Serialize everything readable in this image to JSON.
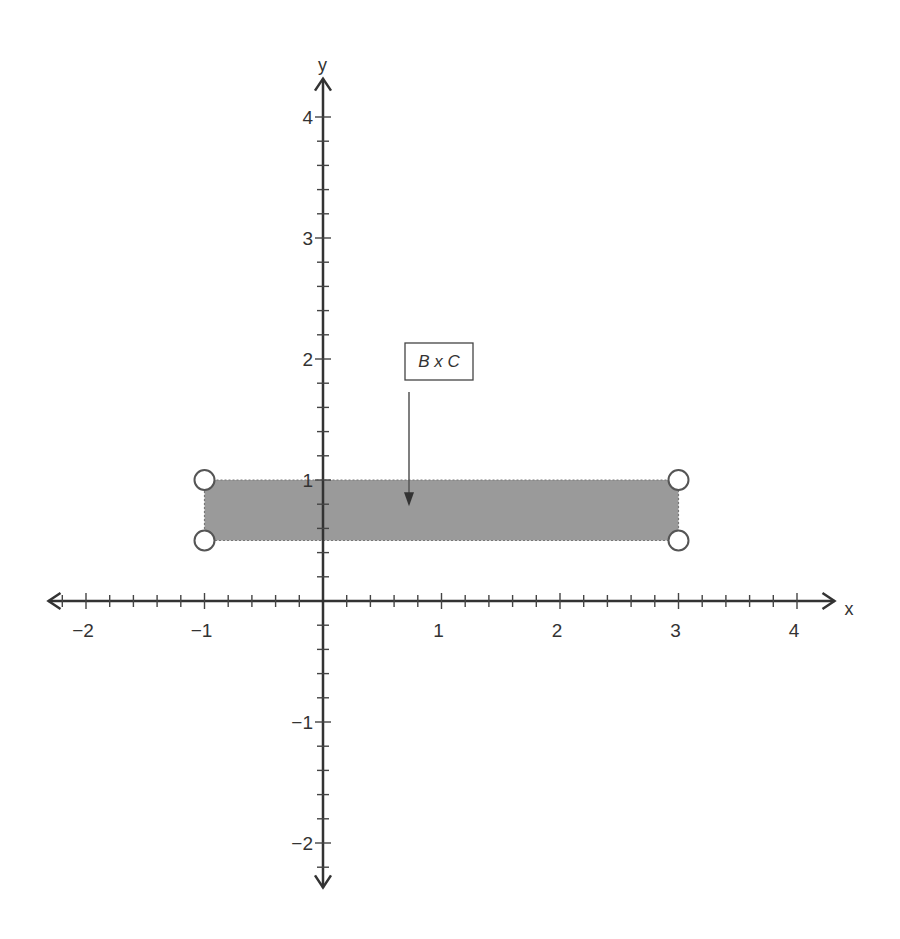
{
  "chart_data": {
    "type": "coordinate-plane",
    "title": "",
    "xlabel": "x",
    "ylabel": "y",
    "xlim": [
      -2.35,
      4.35
    ],
    "ylim": [
      -2.4,
      4.35
    ],
    "x_major_ticks": [
      -2,
      -1,
      1,
      2,
      3,
      4
    ],
    "y_major_ticks": [
      -2,
      -1,
      1,
      2,
      3,
      4
    ],
    "x_tick_labels": [
      "−2",
      "−1",
      "1",
      "2",
      "3",
      "4"
    ],
    "y_tick_labels": [
      "−2",
      "−1",
      "1",
      "2",
      "3",
      "4"
    ],
    "minor_tick_step": 0.2,
    "grid": false,
    "shaded_region": {
      "name": "B x C",
      "x_range": [
        -1,
        3
      ],
      "y_range": [
        0.5,
        1
      ],
      "color": "#9a9a9a",
      "endpoints": "open"
    },
    "open_points": [
      {
        "x": -1,
        "y": 1
      },
      {
        "x": 3,
        "y": 1
      },
      {
        "x": -1,
        "y": 0.5
      },
      {
        "x": 3,
        "y": 0.5
      }
    ],
    "annotations": [
      {
        "text": "B x C",
        "points_to": {
          "x": 0.7,
          "y": 0.8
        }
      }
    ]
  }
}
